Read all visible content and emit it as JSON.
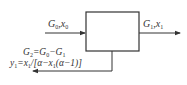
{
  "diagram": {
    "type": "process-block",
    "block": {
      "label": ""
    },
    "input": {
      "name": "G",
      "sub": "0",
      "sep": ",",
      "var": "x",
      "var_sub": "0"
    },
    "output": {
      "name": "G",
      "sub": "1",
      "sep": ",",
      "var": "x",
      "var_sub": "1"
    },
    "side_stream": {
      "eq1": {
        "lhs": "G",
        "lhs_sub": "2",
        "rhs": "=G",
        "rhs_sub1": "0",
        "minus": "−G",
        "rhs_sub2": "1"
      },
      "eq2": {
        "lhs": "y",
        "lhs_sub": "1",
        "eq": "=x",
        "sub_a": "1",
        "mid": "/[α−x",
        "sub_b": "1",
        "tail": "(α−1)]"
      }
    },
    "colors": {
      "stroke": "#333333",
      "text": "#333333",
      "background": "#ffffff"
    }
  }
}
